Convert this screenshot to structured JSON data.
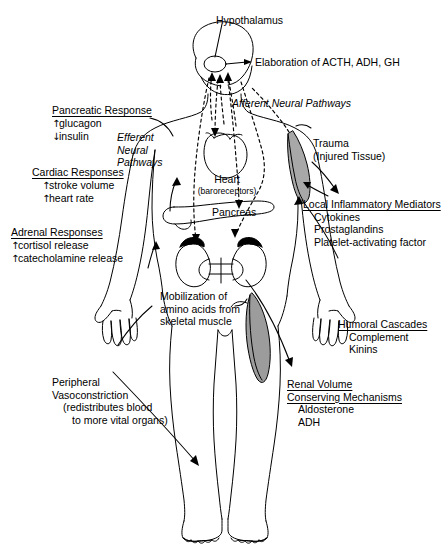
{
  "diagram": {
    "colors": {
      "stroke": "#000000",
      "background": "#ffffff",
      "injured_tissue_fill": "#a8a8a8",
      "muscle_fill": "#9c9c9c",
      "adrenal_fill": "#000000"
    }
  },
  "labels": {
    "hypothalamus": "Hypothalamus",
    "elaboration": "Elaboration of ACTH, ADH, GH",
    "afferent_pathways": "Afferent Neural Pathways",
    "efferent_pathways_l1": "Efferent",
    "efferent_pathways_l2": "Neural",
    "efferent_pathways_l3": "Pathways",
    "heart": "Heart",
    "heart_sub": "(baroreceptors)",
    "pancreas": "Pancreas",
    "trauma_l1": "Trauma",
    "trauma_l2": "(Injured Tissue)"
  },
  "panels": {
    "pancreatic": {
      "heading": "Pancreatic Response",
      "items": [
        {
          "arrow": "↑",
          "text": "glucagon"
        },
        {
          "arrow": "↓",
          "text": "insulin"
        }
      ]
    },
    "cardiac": {
      "heading": "Cardiac Responses",
      "items": [
        {
          "arrow": "↑",
          "text": "stroke volume"
        },
        {
          "arrow": "↑",
          "text": "heart rate"
        }
      ]
    },
    "adrenal": {
      "heading": "Adrenal Responses",
      "items": [
        {
          "arrow": "↑",
          "text": "cortisol release"
        },
        {
          "arrow": "↑",
          "text": "catecholamine release"
        }
      ]
    },
    "peripheral": {
      "line1": "Peripheral",
      "line2": "Vasoconstriction",
      "line3": "(redistributes blood",
      "line4": "to more vital organs)"
    },
    "mobilization": {
      "line1": "Mobilization of",
      "line2": "amino acids from",
      "line3": "skeletal muscle"
    },
    "local_inflammatory": {
      "heading": "Local Inflammatory Mediators",
      "items": [
        "Cytokines",
        "Prostaglandins",
        "Platelet-activating factor"
      ]
    },
    "humoral": {
      "heading": "Humoral Cascades",
      "items": [
        "Complement",
        "Kinins"
      ]
    },
    "renal": {
      "heading_l1": "Renal Volume",
      "heading_l2": "Conserving Mechanisms",
      "items": [
        "Aldosterone",
        "ADH"
      ]
    }
  },
  "icons": {
    "up_arrow": "up-arrow-icon",
    "down_arrow": "down-arrow-icon",
    "body_outline": "human-body-outline-icon",
    "heart": "heart-icon",
    "pancreas": "pancreas-icon",
    "kidneys": "kidneys-icon",
    "hypothalamus": "hypothalamus-icon",
    "injured_tissue": "injured-tissue-icon",
    "skeletal_muscle": "skeletal-muscle-icon"
  }
}
